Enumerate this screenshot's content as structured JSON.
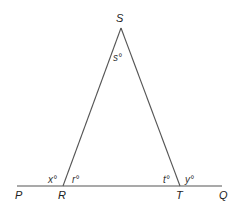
{
  "diagram": {
    "points": {
      "S": "S",
      "R": "R",
      "T": "T",
      "P": "P",
      "Q": "Q"
    },
    "angles": {
      "s": "s°",
      "r": "r°",
      "t": "t°",
      "x": "x°",
      "y": "y°"
    },
    "line_color": "#555555"
  }
}
